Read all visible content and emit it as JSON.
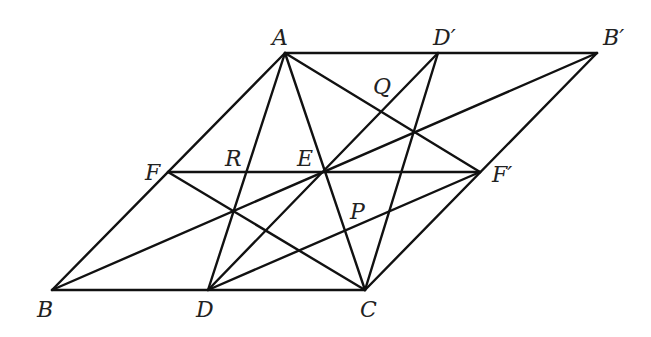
{
  "diagram": {
    "points": {
      "A": {
        "label": "A"
      },
      "Dp": {
        "label": "D′"
      },
      "Bp": {
        "label": "B′"
      },
      "F": {
        "label": "F"
      },
      "E": {
        "label": "E"
      },
      "Fp": {
        "label": "F′"
      },
      "B": {
        "label": "B"
      },
      "D": {
        "label": "D"
      },
      "C": {
        "label": "C"
      },
      "P": {
        "label": "P"
      },
      "Q": {
        "label": "Q"
      },
      "R": {
        "label": "R"
      }
    },
    "segments": [
      [
        "A",
        "Bp"
      ],
      [
        "B",
        "C"
      ],
      [
        "A",
        "B"
      ],
      [
        "Bp",
        "C"
      ],
      [
        "F",
        "Fp"
      ],
      [
        "A",
        "D"
      ],
      [
        "A",
        "C"
      ],
      [
        "A",
        "Fp"
      ],
      [
        "F",
        "C"
      ],
      [
        "B",
        "Bp"
      ],
      [
        "D",
        "Dp"
      ],
      [
        "Dp",
        "C"
      ],
      [
        "D",
        "Fp"
      ]
    ],
    "labeled_intersections": [
      "P",
      "Q",
      "R"
    ]
  }
}
